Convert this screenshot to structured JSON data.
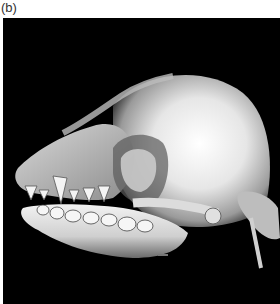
{
  "figure": {
    "panel_label": "(b)",
    "image": {
      "subject": "3D CT volume rendering of brachycephalic dog skull, lateral view",
      "background_color": "#000000",
      "bone_color": "#e8e8e8"
    }
  }
}
